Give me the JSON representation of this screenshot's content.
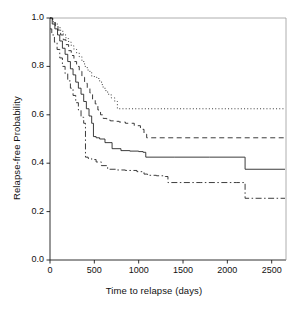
{
  "chart_data": {
    "type": "line",
    "title": "",
    "subtitle": "",
    "xlabel": "Time to relapse (days)",
    "ylabel": "Relapse-free Probability",
    "xlim": [
      0,
      2650
    ],
    "ylim": [
      0.0,
      1.0
    ],
    "xticks": [
      0,
      500,
      1000,
      1500,
      2000,
      2500
    ],
    "xticklabels": [
      "0",
      "500",
      "1000",
      "1500",
      "2000",
      "2500"
    ],
    "yticks": [
      0.0,
      0.2,
      0.4,
      0.6,
      0.8,
      1.0
    ],
    "yticklabels": [
      "0.0",
      "0.2",
      "0.4",
      "0.6",
      "0.8",
      "1.0"
    ],
    "grid": false,
    "legend": "none",
    "legend_position": "none",
    "axis_color": "#1a1a1a",
    "line_color": "#1a1a1a",
    "plot_background": "#ffffff",
    "step_type": "post",
    "series": [
      {
        "name": "curve-1-dotted",
        "style": "dotted",
        "dasharray": "1,2.2",
        "plateau_value": 0.625,
        "x": [
          0,
          30,
          60,
          90,
          120,
          150,
          180,
          210,
          240,
          270,
          300,
          330,
          360,
          390,
          420,
          450,
          470,
          500,
          530,
          560,
          590,
          620,
          650,
          690,
          730,
          760,
          2650
        ],
        "y": [
          1.0,
          0.985,
          0.975,
          0.96,
          0.945,
          0.93,
          0.915,
          0.9,
          0.885,
          0.87,
          0.855,
          0.84,
          0.82,
          0.8,
          0.785,
          0.775,
          0.76,
          0.755,
          0.75,
          0.735,
          0.715,
          0.7,
          0.685,
          0.67,
          0.655,
          0.625,
          0.625
        ]
      },
      {
        "name": "curve-2-dashed",
        "style": "dashed",
        "dasharray": "5,3.5",
        "plateau_value": 0.505,
        "x": [
          0,
          30,
          60,
          90,
          120,
          150,
          180,
          210,
          240,
          270,
          300,
          330,
          360,
          390,
          420,
          450,
          480,
          510,
          540,
          570,
          600,
          640,
          680,
          720,
          780,
          850,
          950,
          1020,
          1060,
          1090,
          2650
        ],
        "y": [
          1.0,
          0.98,
          0.965,
          0.95,
          0.93,
          0.91,
          0.89,
          0.865,
          0.845,
          0.82,
          0.8,
          0.78,
          0.755,
          0.73,
          0.71,
          0.69,
          0.665,
          0.645,
          0.62,
          0.6,
          0.585,
          0.578,
          0.575,
          0.573,
          0.57,
          0.565,
          0.555,
          0.54,
          0.52,
          0.505,
          0.505
        ]
      },
      {
        "name": "curve-3-solid",
        "style": "solid",
        "dasharray": "",
        "plateau_value": 0.375,
        "x": [
          0,
          25,
          55,
          85,
          110,
          140,
          170,
          200,
          230,
          260,
          290,
          320,
          350,
          380,
          410,
          440,
          470,
          490,
          520,
          560,
          620,
          700,
          800,
          900,
          1000,
          1050,
          1080,
          1400,
          1800,
          2190,
          2200,
          2650
        ],
        "y": [
          1.0,
          0.975,
          0.955,
          0.93,
          0.905,
          0.875,
          0.85,
          0.82,
          0.79,
          0.765,
          0.735,
          0.71,
          0.685,
          0.655,
          0.625,
          0.595,
          0.565,
          0.51,
          0.505,
          0.5,
          0.485,
          0.46,
          0.452,
          0.45,
          0.448,
          0.445,
          0.425,
          0.425,
          0.425,
          0.425,
          0.375,
          0.375
        ]
      },
      {
        "name": "curve-4-dashdot",
        "style": "dashdot",
        "dasharray": "6,2.5,1.5,2.5",
        "plateau_value": 0.255,
        "x": [
          0,
          20,
          50,
          80,
          110,
          140,
          170,
          200,
          230,
          260,
          290,
          320,
          350,
          380,
          400,
          430,
          470,
          520,
          580,
          650,
          740,
          850,
          980,
          1060,
          1100,
          1200,
          1300,
          1330,
          1700,
          2100,
          2190,
          2200,
          2650
        ],
        "y": [
          0.955,
          0.93,
          0.9,
          0.87,
          0.835,
          0.8,
          0.77,
          0.74,
          0.71,
          0.68,
          0.65,
          0.62,
          0.59,
          0.565,
          0.425,
          0.42,
          0.415,
          0.405,
          0.39,
          0.375,
          0.372,
          0.37,
          0.365,
          0.355,
          0.35,
          0.348,
          0.345,
          0.32,
          0.32,
          0.32,
          0.32,
          0.255,
          0.255
        ]
      }
    ],
    "notable_drops": [
      {
        "series": "curve-3-solid",
        "x": 2200,
        "from": 0.425,
        "to": 0.375
      },
      {
        "series": "curve-4-dashdot",
        "x": 2200,
        "from": 0.32,
        "to": 0.255
      },
      {
        "series": "curve-4-dashdot",
        "x": 1330,
        "from": 0.35,
        "to": 0.32
      },
      {
        "series": "curve-2-dashed",
        "x": 1090,
        "from": 0.52,
        "to": 0.505
      },
      {
        "series": "curve-3-solid",
        "x": 1080,
        "from": 0.445,
        "to": 0.425
      }
    ]
  },
  "figure": {
    "caption_strip": ""
  }
}
